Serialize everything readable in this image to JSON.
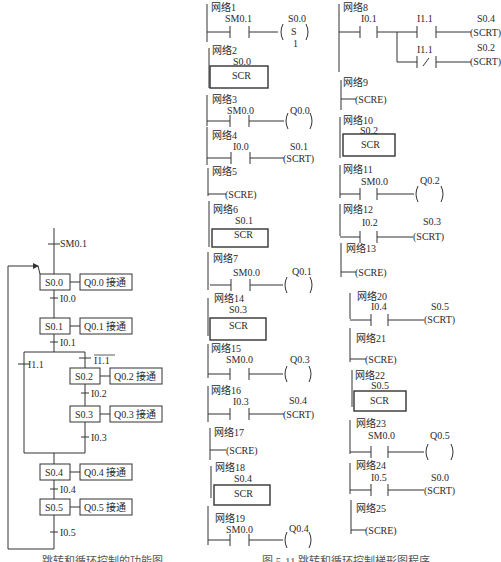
{
  "sfc": {
    "initial_transition": "SM0.1",
    "steps": [
      {
        "id": "S0.0",
        "action": "Q0.0 接通"
      },
      {
        "id": "S0.1",
        "action": "Q0.1 接通"
      },
      {
        "id": "S0.2",
        "action": "Q0.2 接通"
      },
      {
        "id": "S0.3",
        "action": "Q0.3 接通"
      },
      {
        "id": "S0.4",
        "action": "Q0.4 接通"
      },
      {
        "id": "S0.5",
        "action": "Q0.5 接通"
      }
    ],
    "transitions": {
      "t0": "I0.0",
      "t1": "I0.1",
      "branch_left": "I1.1",
      "branch_right": "I1.1",
      "t2": "I0.2",
      "t3": "I0.3",
      "t4": "I0.4",
      "t5": "I0.5"
    }
  },
  "ladder": {
    "networks": [
      {
        "label": "网络1",
        "contact": "SM0.1",
        "coil_addr": "S0.0",
        "coil": "S",
        "coil_n": "1"
      },
      {
        "label": "网络2",
        "box_addr": "S0.0",
        "box": "SCR"
      },
      {
        "label": "网络3",
        "contact": "SM0.0",
        "coil_addr": "Q0.0"
      },
      {
        "label": "网络4",
        "contact": "I0.0",
        "coil_addr": "S0.1",
        "coil": "SCRT"
      },
      {
        "label": "网络5",
        "coil": "SCRE"
      },
      {
        "label": "网络6",
        "box_addr": "S0.1",
        "box": "SCR"
      },
      {
        "label": "网络7",
        "contact": "SM0.0",
        "coil_addr": "Q0.1"
      },
      {
        "label": "网络8",
        "contact": "I0.1",
        "contact2": "I1.1",
        "coil_addr": "S0.4",
        "coil": "SCRT",
        "contact3": "I1.1",
        "contact3_type": "/",
        "coil2_addr": "S0.2",
        "coil2": "SCRT"
      },
      {
        "label": "网络9",
        "coil": "SCRE"
      },
      {
        "label": "网络10",
        "box_addr": "S0.2",
        "box": "SCR"
      },
      {
        "label": "网络11",
        "contact": "SM0.0",
        "coil_addr": "Q0.2"
      },
      {
        "label": "网络12",
        "contact": "I0.2",
        "coil_addr": "S0.3",
        "coil": "SCRT"
      },
      {
        "label": "网络13",
        "coil": "SCRE"
      },
      {
        "label": "网络14",
        "box_addr": "S0.3",
        "box": "SCR"
      },
      {
        "label": "网络15",
        "contact": "SM0.0",
        "coil_addr": "Q0.3"
      },
      {
        "label": "网络16",
        "contact": "I0.3",
        "coil_addr": "S0.4",
        "coil": "SCRT"
      },
      {
        "label": "网络17",
        "coil": "SCRE"
      },
      {
        "label": "网络18",
        "box_addr": "S0.4",
        "box": "SCR"
      },
      {
        "label": "网络19",
        "contact": "SM0.0",
        "coil_addr": "Q0.4"
      },
      {
        "label": "网络20",
        "contact": "I0.4",
        "coil_addr": "S0.5",
        "coil": "SCRT"
      },
      {
        "label": "网络21",
        "coil": "SCRE"
      },
      {
        "label": "网络22",
        "box_addr": "S0.5",
        "box": "SCR"
      },
      {
        "label": "网络23",
        "contact": "SM0.0",
        "coil_addr": "Q0.5"
      },
      {
        "label": "网络24",
        "contact": "I0.5",
        "coil_addr": "S0.0",
        "coil": "SCRT"
      },
      {
        "label": "网络25",
        "coil": "SCRE"
      }
    ]
  },
  "captions": {
    "left": "跳转和循环控制的功能图",
    "right": "图 5-11  跳转和循环控制梯形图程序"
  }
}
